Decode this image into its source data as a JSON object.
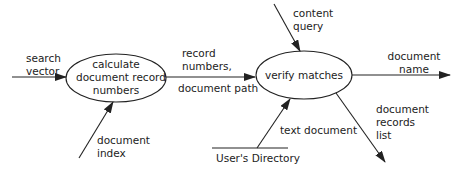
{
  "diagram": {
    "processes": [
      {
        "id": "p1",
        "label_lines": [
          "calculate",
          "document record",
          "numbers"
        ]
      },
      {
        "id": "p2",
        "label_lines": [
          "verify matches"
        ]
      }
    ],
    "flows": {
      "search_vector": [
        "search",
        "vector"
      ],
      "document_index": [
        "document",
        "index"
      ],
      "record_numbers": [
        "record",
        "numbers,"
      ],
      "document_path": "document path",
      "content_query": [
        "content",
        "query"
      ],
      "text_document": "text document",
      "document_name": [
        "document",
        "name"
      ],
      "document_records_list": [
        "document",
        "records",
        "list"
      ]
    },
    "data_store": {
      "label": "User's Directory"
    },
    "colors": {
      "stroke": "#222222",
      "text": "#222222",
      "background": "#ffffff"
    }
  }
}
